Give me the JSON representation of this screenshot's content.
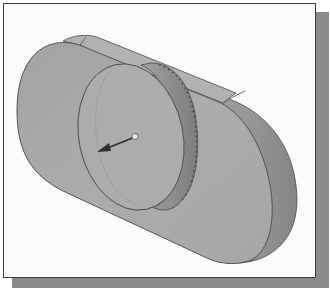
{
  "figure": {
    "colors": {
      "background": "#fbfbfb",
      "frame_border": "#3c3c3c",
      "frame_shadow": "#8a8a8a",
      "plate_face": "#a9a9a9",
      "plate_side": "#9a9a9a",
      "plate_top": "#b3b3b3",
      "boss_face": "#adadad",
      "boss_side": "#8f8f8f",
      "edge_line": "#4a4a4a",
      "arrow": "#2e2e2e",
      "arrow_origin": "#e8e8e8"
    },
    "parts": [
      {
        "name": "obround-plate",
        "type": "extruded slot / rounded rectangle"
      },
      {
        "name": "cylindrical-boss",
        "type": "disk extrusion on plate face"
      },
      {
        "name": "direction-arrow",
        "type": "extrude direction indicator"
      }
    ]
  }
}
